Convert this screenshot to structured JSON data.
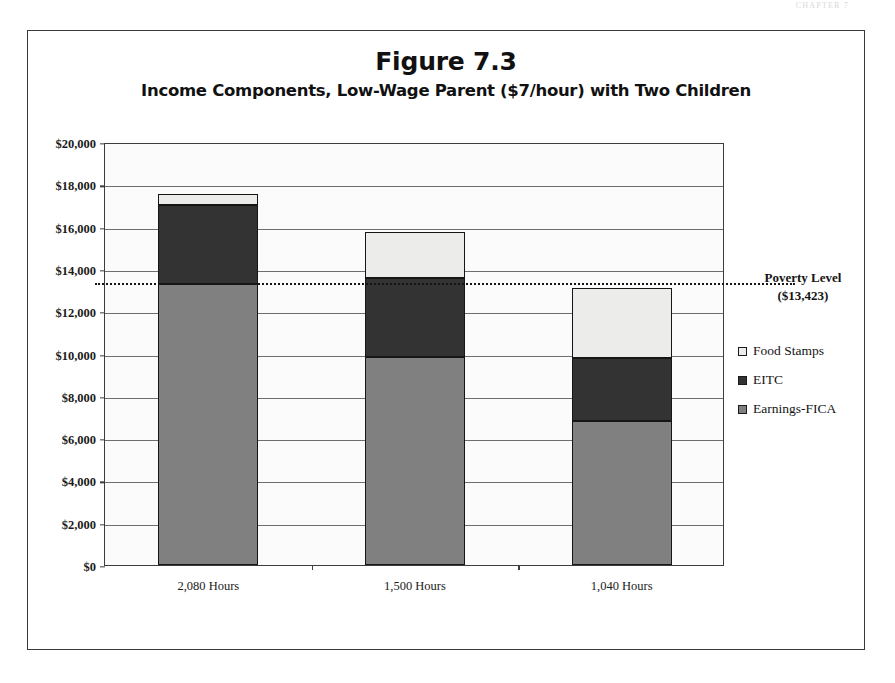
{
  "page": {
    "header_scrap": "CHAPTER 7"
  },
  "figure": {
    "title": "Figure 7.3",
    "subtitle": "Income Components, Low-Wage Parent ($7/hour) with Two Children"
  },
  "annotations": {
    "poverty_label": "Poverty Level",
    "poverty_value": "($13,423)"
  },
  "legend": {
    "items": [
      {
        "label": "Food Stamps",
        "color": "#ececeb"
      },
      {
        "label": "EITC",
        "color": "#333333"
      },
      {
        "label": "Earnings-FICA",
        "color": "#808080"
      }
    ]
  },
  "chart_data": {
    "type": "bar",
    "subtype": "stacked",
    "title": "Figure 7.3",
    "subtitle": "Income Components, Low-Wage Parent ($7/hour) with Two Children",
    "xlabel": "",
    "ylabel": "",
    "ylim": [
      0,
      20000
    ],
    "ytick_step": 2000,
    "grid": true,
    "grid_axis": "y",
    "legend_position": "right",
    "categories": [
      "2,080 Hours",
      "1,500  Hours",
      "1,040 Hours"
    ],
    "ytick_labels": [
      "$0",
      "$2,000",
      "$4,000",
      "$6,000",
      "$8,000",
      "$10,000",
      "$12,000",
      "$14,000",
      "$16,000",
      "$18,000",
      "$20,000"
    ],
    "ytick_values": [
      0,
      2000,
      4000,
      6000,
      8000,
      10000,
      12000,
      14000,
      16000,
      18000,
      20000
    ],
    "series": [
      {
        "name": "Earnings-FICA",
        "color": "#808080",
        "values": [
          13300,
          9850,
          6800
        ]
      },
      {
        "name": "EITC",
        "color": "#333333",
        "values": [
          3700,
          3700,
          3000
        ]
      },
      {
        "name": "Food Stamps",
        "color": "#ececeb",
        "values": [
          550,
          2200,
          3300
        ]
      }
    ],
    "totals": [
      17550,
      15750,
      13100
    ],
    "reference_line": {
      "label": "Poverty Level",
      "value_label": "($13,423)",
      "value": 13423,
      "style": "dotted"
    }
  }
}
